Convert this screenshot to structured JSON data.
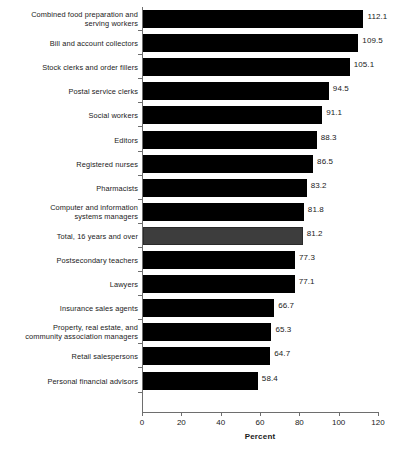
{
  "chart_data": {
    "type": "bar",
    "orientation": "horizontal",
    "title": "",
    "xlabel": "Percent",
    "ylabel": "",
    "xlim": [
      0,
      120
    ],
    "xticks": [
      0,
      20,
      40,
      60,
      80,
      100,
      120
    ],
    "grid": false,
    "legend": null,
    "categories": [
      "Combined food preparation and serving workers",
      "Bill and account collectors",
      "Stock clerks and order fillers",
      "Postal service clerks",
      "Social workers",
      "Editors",
      "Registered nurses",
      "Pharmacists",
      "Computer and information systems managers",
      "Total, 16 years and over",
      "Postsecondary teachers",
      "Lawyers",
      "Insurance sales agents",
      "Property, real estate, and community association managers",
      "Retail salespersons",
      "Personal financial advisors"
    ],
    "values": [
      112.1,
      109.5,
      105.1,
      94.5,
      91.1,
      88.3,
      86.5,
      83.2,
      81.8,
      81.2,
      77.3,
      77.1,
      66.7,
      65.3,
      64.7,
      58.4
    ],
    "bars": [
      {
        "label_lines": [
          "Combined food preparation and",
          "serving workers"
        ],
        "value": 112.1,
        "value_text": "112.1",
        "highlight": false
      },
      {
        "label_lines": [
          "Bill and account collectors"
        ],
        "value": 109.5,
        "value_text": "109.5",
        "highlight": false
      },
      {
        "label_lines": [
          "Stock clerks and order fillers"
        ],
        "value": 105.1,
        "value_text": "105.1",
        "highlight": false
      },
      {
        "label_lines": [
          "Postal service clerks"
        ],
        "value": 94.5,
        "value_text": "94.5",
        "highlight": false
      },
      {
        "label_lines": [
          "Social workers"
        ],
        "value": 91.1,
        "value_text": "91.1",
        "highlight": false
      },
      {
        "label_lines": [
          "Editors"
        ],
        "value": 88.3,
        "value_text": "88.3",
        "highlight": false
      },
      {
        "label_lines": [
          "Registered nurses"
        ],
        "value": 86.5,
        "value_text": "86.5",
        "highlight": false
      },
      {
        "label_lines": [
          "Pharmacists"
        ],
        "value": 83.2,
        "value_text": "83.2",
        "highlight": false
      },
      {
        "label_lines": [
          "Computer and information",
          "systems managers"
        ],
        "value": 81.8,
        "value_text": "81.8",
        "highlight": false
      },
      {
        "label_lines": [
          "Total, 16 years and over"
        ],
        "value": 81.2,
        "value_text": "81.2",
        "highlight": true
      },
      {
        "label_lines": [
          "Postsecondary teachers"
        ],
        "value": 77.3,
        "value_text": "77.3",
        "highlight": false
      },
      {
        "label_lines": [
          "Lawyers"
        ],
        "value": 77.1,
        "value_text": "77.1",
        "highlight": false
      },
      {
        "label_lines": [
          "Insurance sales agents"
        ],
        "value": 66.7,
        "value_text": "66.7",
        "highlight": false
      },
      {
        "label_lines": [
          "Property, real estate, and",
          "community association managers"
        ],
        "value": 65.3,
        "value_text": "65.3",
        "highlight": false
      },
      {
        "label_lines": [
          "Retail salespersons"
        ],
        "value": 64.7,
        "value_text": "64.7",
        "highlight": false
      },
      {
        "label_lines": [
          "Personal financial advisors"
        ],
        "value": 58.4,
        "value_text": "58.4",
        "highlight": false
      }
    ],
    "colors": {
      "bar": "#000000",
      "bar_highlight": "#3d3d3d",
      "axis": "#6e6e6e",
      "text": "#1a1a1a",
      "background": "#ffffff"
    }
  }
}
